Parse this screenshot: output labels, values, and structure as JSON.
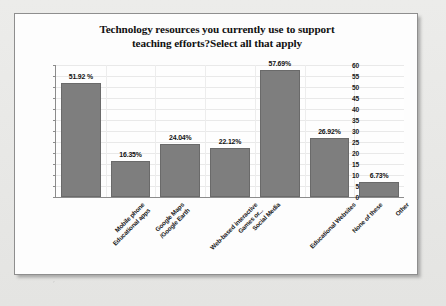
{
  "chart_data": {
    "type": "bar",
    "title": "Technology resources you currently use to support teaching efforts?Select all that apply",
    "title_line1": "Technology resources you currently use to support",
    "title_line2": "teaching efforts?Select all that apply",
    "xlabel": "",
    "ylabel": "",
    "ylim": [
      0,
      60
    ],
    "yticks": [
      0,
      5,
      10,
      15,
      20,
      25,
      30,
      35,
      40,
      45,
      50,
      55,
      60
    ],
    "ytick_labels": [
      "0",
      "5",
      "10",
      "15",
      "20",
      "25",
      "30",
      "35",
      "40",
      "45",
      "50",
      "55",
      "60"
    ],
    "grid": true,
    "legend": false,
    "bar_color": "#7e7e7e",
    "categories": [
      "Mobile phone Educational apps",
      "Google Maps /Google Earth",
      "Web-based interactive Games or...",
      "Social Media",
      "Educational Websites",
      "None of these",
      "Other"
    ],
    "category_lines": [
      [
        "Mobile phone",
        "Educational apps"
      ],
      [
        "Google Maps",
        "/Google Earth"
      ],
      [
        "Web-based interactive",
        "Games or..."
      ],
      [
        "Social Media",
        ""
      ],
      [
        "Educational Websites",
        ""
      ],
      [
        "None of these",
        ""
      ],
      [
        "Other",
        ""
      ]
    ],
    "values": [
      51.92,
      16.35,
      24.04,
      22.12,
      57.69,
      26.92,
      6.73
    ],
    "data_labels": [
      "51.92 %",
      "16.35%",
      "24.04%",
      "22.12%",
      "57.69%",
      "26.92%",
      "6.73%"
    ]
  }
}
